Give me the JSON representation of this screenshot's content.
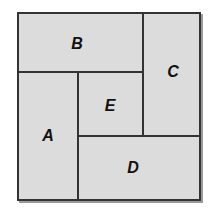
{
  "diagram": {
    "regions": [
      {
        "id": "A",
        "label": "A"
      },
      {
        "id": "B",
        "label": "B"
      },
      {
        "id": "C",
        "label": "C"
      },
      {
        "id": "D",
        "label": "D"
      },
      {
        "id": "E",
        "label": "E"
      }
    ],
    "colors": {
      "fill": "#dcdcdc",
      "stroke": "#333333",
      "shadow": "#9a9a9a"
    }
  }
}
